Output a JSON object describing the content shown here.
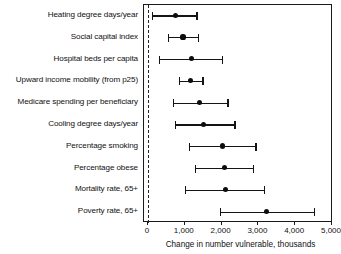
{
  "chart_data": {
    "type": "scatter",
    "title": "",
    "xlabel": "Change in number vulnerable, thousands",
    "ylabel": "",
    "xlim": [
      0,
      5000
    ],
    "xticks": [
      0,
      1000,
      2000,
      3000,
      4000,
      5000
    ],
    "xtick_labels": [
      "0",
      "1,000",
      "2,000",
      "3,000",
      "4,000",
      "5,000"
    ],
    "grid": false,
    "legend": null,
    "reference_line": {
      "x": 0,
      "style": "dashed"
    },
    "orientation": "horizontal",
    "marker": "filled-circle-with-error-bars",
    "categories": [
      "Heating degree days/year",
      "Social capital index",
      "Hospital beds per capita",
      "Upward income mobility (from p25)",
      "Medicare spending per beneficiary",
      "Cooling degree days/year",
      "Percentage smoking",
      "Percentage obese",
      "Mortality rate, 65+",
      "Poverty rate, 65+"
    ],
    "values": [
      750,
      950,
      1190,
      1160,
      1400,
      1510,
      2030,
      2080,
      2110,
      3220
    ],
    "ci_lower": [
      110,
      540,
      300,
      840,
      680,
      730,
      1110,
      1270,
      1000,
      1950
    ],
    "ci_upper": [
      1350,
      1380,
      2050,
      1510,
      2190,
      2380,
      2950,
      2890,
      3190,
      4540
    ],
    "points": [
      {
        "label": "Heating degree days/year",
        "estimate": 750,
        "lower": 110,
        "upper": 1350
      },
      {
        "label": "Social capital index",
        "estimate": 950,
        "lower": 540,
        "upper": 1380
      },
      {
        "label": "Hospital beds per capita",
        "estimate": 1190,
        "lower": 300,
        "upper": 2050
      },
      {
        "label": "Upward income mobility (from p25)",
        "estimate": 1160,
        "lower": 840,
        "upper": 1510
      },
      {
        "label": "Medicare spending per beneficiary",
        "estimate": 1400,
        "lower": 680,
        "upper": 2190
      },
      {
        "label": "Cooling degree days/year",
        "estimate": 1510,
        "lower": 730,
        "upper": 2380
      },
      {
        "label": "Percentage smoking",
        "estimate": 2030,
        "lower": 1110,
        "upper": 2950
      },
      {
        "label": "Percentage obese",
        "estimate": 2080,
        "lower": 1270,
        "upper": 2890
      },
      {
        "label": "Mortality rate, 65+",
        "estimate": 2110,
        "lower": 1000,
        "upper": 3190
      },
      {
        "label": "Poverty rate, 65+",
        "estimate": 3220,
        "lower": 1950,
        "upper": 4540
      }
    ]
  },
  "colors": {
    "marker": "#0d0d0d",
    "line": "#141414",
    "axis": "#1a1a1a",
    "text": "#111111",
    "background": "#ffffff"
  }
}
